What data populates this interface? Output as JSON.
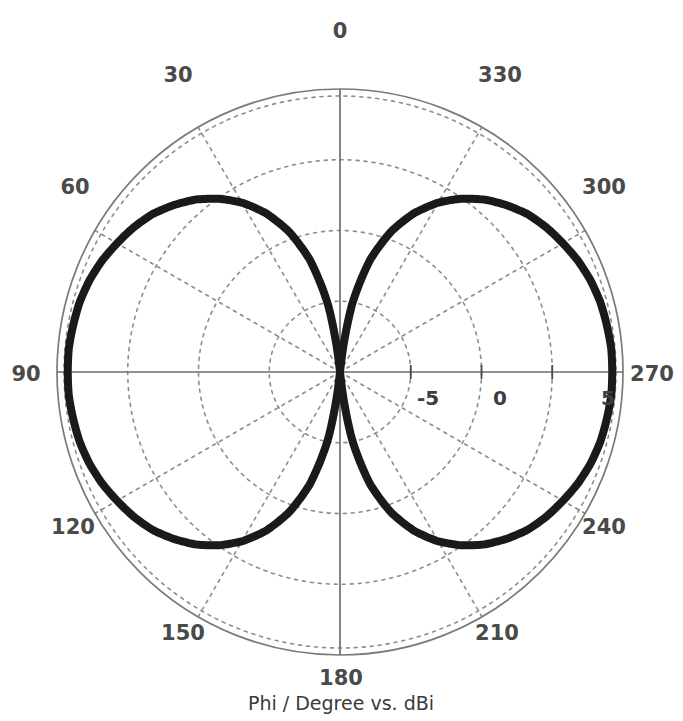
{
  "caption": "Phi / Degree vs. dBi",
  "colors": {
    "curve": "#1a1a1a",
    "grid": "#8d8d8d",
    "axis": "#6e6e6e",
    "outer_circle": "#7a7a7a",
    "label": "#4a4a4a",
    "background": "#ffffff"
  },
  "angle_labels": {
    "a0": "0",
    "a30": "30",
    "a60": "60",
    "a90": "90",
    "a120": "120",
    "a150": "150",
    "a180": "180",
    "a210": "210",
    "a240": "240",
    "a270": "270",
    "a300": "300",
    "a330": "330"
  },
  "radial_labels": {
    "r_minus5": "-5",
    "r_0": "0",
    "r_5": "5"
  },
  "chart_data": {
    "type": "line",
    "subtype": "polar",
    "title": "",
    "subtitle": "",
    "xlabel": "Phi / Degree",
    "ylabel": "dBi",
    "caption": "Phi / Degree vs. dBi",
    "grid": true,
    "legend": null,
    "angle_unit": "degree",
    "angle_direction": "clockwise-negative",
    "theta_zero_location": "N",
    "angle_ticks": [
      0,
      30,
      60,
      90,
      120,
      150,
      180,
      210,
      240,
      270,
      300,
      330
    ],
    "angle_tick_labels": [
      "0",
      "30",
      "60",
      "90",
      "120",
      "150",
      "180",
      "210",
      "240",
      "270",
      "300",
      "330"
    ],
    "r_ticks": [
      -5,
      0,
      5
    ],
    "r_tick_labels": [
      "-5",
      "0",
      "5"
    ],
    "rlim": [
      -15,
      6
    ],
    "r_outer_value": 6,
    "r_grid_circles": [
      -10,
      -5,
      0,
      5
    ],
    "series": [
      {
        "name": "Gain",
        "unit": "dBi",
        "peak_value": 5.2,
        "peak_angles": [
          90,
          270
        ],
        "null_angles": [
          0,
          180
        ],
        "theta": [
          0,
          5,
          10,
          15,
          20,
          25,
          30,
          35,
          40,
          45,
          50,
          55,
          60,
          65,
          70,
          75,
          80,
          85,
          90,
          95,
          100,
          105,
          110,
          115,
          120,
          125,
          130,
          135,
          140,
          145,
          150,
          155,
          160,
          165,
          170,
          175,
          180,
          185,
          190,
          195,
          200,
          205,
          210,
          215,
          220,
          225,
          230,
          235,
          240,
          245,
          250,
          255,
          260,
          265,
          270,
          275,
          280,
          285,
          290,
          295,
          300,
          305,
          310,
          315,
          320,
          325,
          330,
          335,
          340,
          345,
          350,
          355,
          360
        ],
        "values": [
          -28.0,
          -16.0,
          -10.0,
          -6.4,
          -3.9,
          -2.0,
          -0.5,
          0.7,
          1.7,
          2.5,
          3.2,
          3.7,
          4.1,
          4.5,
          4.8,
          5.0,
          5.1,
          5.2,
          5.2,
          5.2,
          5.1,
          5.0,
          4.8,
          4.5,
          4.1,
          3.7,
          3.2,
          2.5,
          1.7,
          0.7,
          -0.5,
          -2.0,
          -3.9,
          -6.4,
          -10.0,
          -16.0,
          -28.0,
          -16.0,
          -10.0,
          -6.4,
          -3.9,
          -2.0,
          -0.5,
          0.7,
          1.7,
          2.5,
          3.2,
          3.7,
          4.1,
          4.5,
          4.8,
          5.0,
          5.1,
          5.2,
          5.2,
          5.2,
          5.1,
          5.0,
          4.8,
          4.5,
          4.1,
          3.7,
          3.2,
          2.5,
          1.7,
          0.7,
          -0.5,
          -2.0,
          -3.9,
          -6.4,
          -10.0,
          -16.0,
          -28.0
        ]
      }
    ]
  },
  "geometry": {
    "center_x": 340,
    "center_y": 372,
    "outer_radius": 283
  }
}
